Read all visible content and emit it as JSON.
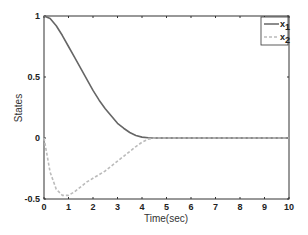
{
  "chart_data": {
    "type": "line",
    "title": "",
    "xlabel": "Time(sec)",
    "ylabel": "States",
    "xlim": [
      0,
      10
    ],
    "ylim": [
      -0.5,
      1
    ],
    "xticks": [
      "0",
      "1",
      "2",
      "3",
      "4",
      "5",
      "6",
      "7",
      "8",
      "9",
      "10"
    ],
    "yticks": [
      "-0.5",
      "0",
      "0.5",
      "1"
    ],
    "grid": false,
    "legend_position": "upper right",
    "x": [
      0,
      0.25,
      0.5,
      0.75,
      1,
      1.25,
      1.5,
      1.75,
      2,
      2.25,
      2.5,
      2.75,
      3,
      3.25,
      3.5,
      3.75,
      4,
      4.25,
      4.5,
      5,
      6,
      7,
      8,
      9,
      10
    ],
    "series": [
      {
        "name": "x1",
        "color": "#666666",
        "style": "solid",
        "values": [
          1,
          0.98,
          0.92,
          0.84,
          0.75,
          0.66,
          0.57,
          0.48,
          0.39,
          0.31,
          0.24,
          0.18,
          0.12,
          0.08,
          0.045,
          0.02,
          0.007,
          0.002,
          0,
          0,
          0,
          0,
          0,
          0,
          0
        ]
      },
      {
        "name": "x2",
        "color": "#bbbbbb",
        "style": "dashed",
        "values": [
          0,
          -0.28,
          -0.42,
          -0.47,
          -0.47,
          -0.44,
          -0.4,
          -0.36,
          -0.33,
          -0.3,
          -0.27,
          -0.23,
          -0.19,
          -0.15,
          -0.11,
          -0.07,
          -0.035,
          -0.01,
          0,
          0,
          0,
          0,
          0,
          0,
          0
        ]
      }
    ]
  }
}
